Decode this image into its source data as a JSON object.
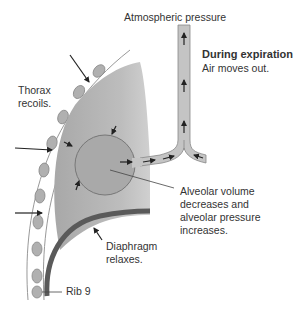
{
  "diagram": {
    "title": "During expiration",
    "subtitle": "Air moves out.",
    "labels": {
      "atmospheric": "Atmospheric pressure",
      "thorax_line1": "Thorax",
      "thorax_line2": "recoils.",
      "alveolar_line1": "Alveolar volume",
      "alveolar_line2": "decreases and",
      "alveolar_line3": "alveolar pressure",
      "alveolar_line4": "increases.",
      "diaphragm_line1": "Diaphragm",
      "diaphragm_line2": "relaxes.",
      "rib": "Rib 9"
    },
    "colors": {
      "lung_fill": "#b8b8b8",
      "alveolus_fill": "#a9a9a9",
      "airway_fill": "#c4c4c4",
      "diaphragm": "#5a5a5a",
      "rib_fill": "#b0b0b0",
      "outline": "#777777",
      "arrow": "#222222"
    }
  }
}
